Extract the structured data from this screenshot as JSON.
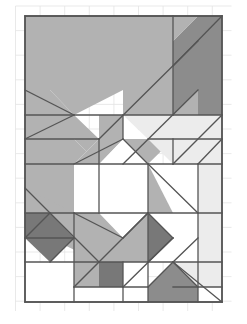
{
  "figure": {
    "type": "vector-diagram",
    "canvas": {
      "width": 247,
      "height": 324,
      "background": "#ffffff"
    },
    "grid": {
      "name": "light-reference-grid",
      "visible": true,
      "stroke": "#e3e3e3",
      "stroke_width": 0.8,
      "cell_width": 24.6,
      "cell_height": 24.6,
      "x_start": 15.5,
      "x_end": 231.5,
      "y_start": 6.0,
      "y_end": 311.0,
      "columns": 9,
      "rows": 13
    },
    "frame": {
      "name": "outer-rectangle",
      "x": 25,
      "y": 16,
      "width": 197,
      "height": 286,
      "stroke": "#555555",
      "stroke_width": 1.6,
      "fill": "none"
    },
    "palette": {
      "white": "#ffffff",
      "light_gray": "#ececec",
      "mid_gray": "#b2b2b2",
      "gray": "#a3a3a3",
      "dark_gray": "#8c8c8c",
      "darkest_gray": "#787878",
      "outline": "#555555",
      "grid_line": "#e3e3e3"
    },
    "shapes": [
      {
        "id": "s01",
        "name": "top-large-slab",
        "fill": "#b2b2b2",
        "points": "25,16 173,16 173,41 198,66 198,115 123,115 123,90 74,115 25,115"
      },
      {
        "id": "s02",
        "name": "top-left-notch-triangle",
        "fill": "#ffffff",
        "points": "25,90 50,90 74,115 25,115"
      },
      {
        "id": "s03",
        "name": "upper-left-wedge",
        "fill": "#b2b2b2",
        "points": "25,90 50,90 74,115 25,139"
      },
      {
        "id": "s04",
        "name": "top-right-dark-block",
        "fill": "#8c8c8c",
        "points": "173,41 198,16 222,16 222,115 173,115"
      },
      {
        "id": "s05",
        "name": "top-right-diagonal-band",
        "fill": "#b2b2b2",
        "points": "173,16 198,16 173,41"
      },
      {
        "id": "s06",
        "name": "left-mid-band",
        "fill": "#b2b2b2",
        "points": "25,115 74,115 99,139 99,164 74,139 25,139"
      },
      {
        "id": "s07",
        "name": "left-column-block",
        "fill": "#b2b2b2",
        "points": "25,139 74,139 99,164 74,213 25,213"
      },
      {
        "id": "s08",
        "name": "center-upper-fan-left",
        "fill": "#b2b2b2",
        "points": "99,115 123,115 123,139 99,164"
      },
      {
        "id": "s09",
        "name": "center-upper-white-wedge",
        "fill": "#ffffff",
        "points": "123,115 148,139 123,139"
      },
      {
        "id": "s10",
        "name": "center-diagonal-band",
        "fill": "#b2b2b2",
        "points": "123,139 148,139 198,90 198,115 148,164"
      },
      {
        "id": "s11",
        "name": "right-light-panel",
        "fill": "#ececec",
        "points": "148,115 198,115 198,164 173,164 148,139"
      },
      {
        "id": "s12",
        "name": "right-light-upper",
        "fill": "#ececec",
        "points": "123,115 198,115 173,139 148,139"
      },
      {
        "id": "s13",
        "name": "octagon-center",
        "fill": "#ffffff",
        "points": "99,164 123,139 148,164 148,213 123,238 99,213"
      },
      {
        "id": "s14",
        "name": "octagon-left-facet",
        "fill": "#ffffff",
        "points": "74,164 99,139 99,213 74,213"
      },
      {
        "id": "s15",
        "name": "octagon-upper-left-gray",
        "fill": "#b2b2b2",
        "points": "74,164 99,139 123,139 99,164"
      },
      {
        "id": "s16",
        "name": "center-right-gray-column",
        "fill": "#b2b2b2",
        "points": "148,164 173,164 198,188 173,213 148,213"
      },
      {
        "id": "s17",
        "name": "right-mid-light",
        "fill": "#ececec",
        "points": "173,139 198,115 222,115 222,164 198,164"
      },
      {
        "id": "s18",
        "name": "right-tall-light-band",
        "fill": "#ececec",
        "points": "198,164 222,164 222,262 198,287 173,262 198,238"
      },
      {
        "id": "s19",
        "name": "right-white-triangle",
        "fill": "#ffffff",
        "points": "148,164 198,164 198,213 173,213"
      },
      {
        "id": "s20",
        "name": "right-lower-white",
        "fill": "#ffffff",
        "points": "148,213 198,213 198,262 148,262"
      },
      {
        "id": "s21",
        "name": "lower-left-mid-gray",
        "fill": "#b2b2b2",
        "points": "25,188 74,213 99,213 123,238 99,262 50,238 25,213"
      },
      {
        "id": "s22",
        "name": "dark-diamond-left",
        "fill": "#787878",
        "points": "25,213 50,213 74,238 50,262 25,238"
      },
      {
        "id": "s23",
        "name": "lower-left-white",
        "fill": "#ffffff",
        "points": "25,262 74,262 74,302 25,302"
      },
      {
        "id": "s24",
        "name": "lower-center-band",
        "fill": "#b2b2b2",
        "points": "74,238 99,262 148,213 173,238 123,287 74,287"
      },
      {
        "id": "s25",
        "name": "dark-triangle-center",
        "fill": "#787878",
        "points": "99,262 148,262 148,287 99,287"
      },
      {
        "id": "s26",
        "name": "dark-triangle-lower-right",
        "fill": "#787878",
        "points": "148,213 173,238 148,262"
      },
      {
        "id": "s27",
        "name": "lower-white-strip",
        "fill": "#ffffff",
        "points": "74,287 123,287 123,302 74,302"
      },
      {
        "id": "s28",
        "name": "bottom-white-panel",
        "fill": "#ffffff",
        "points": "123,262 148,262 148,302 123,302"
      },
      {
        "id": "s29",
        "name": "bottom-dark-wedge",
        "fill": "#8c8c8c",
        "points": "148,287 173,262 198,287 198,302 148,302"
      },
      {
        "id": "s30",
        "name": "bottom-light-wedge",
        "fill": "#ececec",
        "points": "173,262 198,262 198,287"
      },
      {
        "id": "s31",
        "name": "bottom-right-white",
        "fill": "#ffffff",
        "points": "198,287 222,287 222,302 198,302"
      },
      {
        "id": "s32",
        "name": "bottom-right-corner-light",
        "fill": "#ececec",
        "points": "198,262 222,262 222,287 198,287"
      }
    ],
    "edges": [
      {
        "name": "edge-frame-top",
        "x1": 25,
        "y1": 16,
        "x2": 222,
        "y2": 16
      },
      {
        "name": "edge-frame-bottom",
        "x1": 25,
        "y1": 302,
        "x2": 222,
        "y2": 302
      },
      {
        "name": "edge-frame-left",
        "x1": 25,
        "y1": 16,
        "x2": 25,
        "y2": 302
      },
      {
        "name": "edge-frame-right",
        "x1": 222,
        "y1": 16,
        "x2": 222,
        "y2": 302
      },
      {
        "name": "edge-top-slab-bottom",
        "x1": 25,
        "y1": 115,
        "x2": 222,
        "y2": 115
      },
      {
        "name": "edge-row-164",
        "x1": 25,
        "y1": 164,
        "x2": 222,
        "y2": 164
      },
      {
        "name": "edge-row-213",
        "x1": 25,
        "y1": 213,
        "x2": 222,
        "y2": 213
      },
      {
        "name": "edge-row-262",
        "x1": 25,
        "y1": 262,
        "x2": 222,
        "y2": 262
      },
      {
        "name": "edge-row-139-left",
        "x1": 25,
        "y1": 139,
        "x2": 99,
        "y2": 139
      },
      {
        "name": "edge-row-139-right",
        "x1": 148,
        "y1": 139,
        "x2": 222,
        "y2": 139
      },
      {
        "name": "edge-row-238-left",
        "x1": 25,
        "y1": 238,
        "x2": 74,
        "y2": 238
      },
      {
        "name": "edge-row-287-part",
        "x1": 74,
        "y1": 287,
        "x2": 148,
        "y2": 287
      },
      {
        "name": "edge-row-287-right",
        "x1": 173,
        "y1": 287,
        "x2": 222,
        "y2": 287
      },
      {
        "name": "edge-col-74",
        "x1": 74,
        "y1": 213,
        "x2": 74,
        "y2": 302
      },
      {
        "name": "edge-col-99",
        "x1": 99,
        "y1": 139,
        "x2": 99,
        "y2": 213
      },
      {
        "name": "edge-col-123-top",
        "x1": 123,
        "y1": 115,
        "x2": 123,
        "y2": 139
      },
      {
        "name": "edge-col-123-bottom",
        "x1": 123,
        "y1": 262,
        "x2": 123,
        "y2": 302
      },
      {
        "name": "edge-col-148-mid",
        "x1": 148,
        "y1": 164,
        "x2": 148,
        "y2": 262
      },
      {
        "name": "edge-col-148-bottom",
        "x1": 148,
        "y1": 262,
        "x2": 148,
        "y2": 302
      },
      {
        "name": "edge-col-173-top",
        "x1": 173,
        "y1": 16,
        "x2": 173,
        "y2": 115
      },
      {
        "name": "edge-col-173-mid",
        "x1": 173,
        "y1": 139,
        "x2": 173,
        "y2": 164
      },
      {
        "name": "edge-col-198-mid",
        "x1": 198,
        "y1": 164,
        "x2": 198,
        "y2": 302
      },
      {
        "name": "edge-diag-tr",
        "x1": 173,
        "y1": 66,
        "x2": 222,
        "y2": 16
      },
      {
        "name": "edge-diag-long-ne",
        "x1": 99,
        "y1": 139,
        "x2": 198,
        "y2": 41
      },
      {
        "name": "edge-diag-band2",
        "x1": 123,
        "y1": 164,
        "x2": 198,
        "y2": 90
      },
      {
        "name": "edge-diag-ul-1",
        "x1": 25,
        "y1": 90,
        "x2": 74,
        "y2": 115
      },
      {
        "name": "edge-diag-ul-2",
        "x1": 25,
        "y1": 139,
        "x2": 74,
        "y2": 115
      },
      {
        "name": "edge-diag-oct-ul",
        "x1": 74,
        "y1": 164,
        "x2": 123,
        "y2": 139
      },
      {
        "name": "edge-diag-oct-ur",
        "x1": 123,
        "y1": 139,
        "x2": 148,
        "y2": 164
      },
      {
        "name": "edge-diag-oct-ll",
        "x1": 74,
        "y1": 213,
        "x2": 123,
        "y2": 238
      },
      {
        "name": "edge-diag-oct-lr",
        "x1": 123,
        "y1": 238,
        "x2": 148,
        "y2": 213
      },
      {
        "name": "edge-diag-ll-1",
        "x1": 25,
        "y1": 188,
        "x2": 99,
        "y2": 262
      },
      {
        "name": "edge-diag-ll-2",
        "x1": 25,
        "y1": 238,
        "x2": 50,
        "y2": 213
      },
      {
        "name": "edge-diag-ll-3",
        "x1": 50,
        "y1": 262,
        "x2": 74,
        "y2": 238
      },
      {
        "name": "edge-diag-mid-band",
        "x1": 74,
        "y1": 287,
        "x2": 148,
        "y2": 213
      },
      {
        "name": "edge-diag-mid-band2",
        "x1": 123,
        "y1": 287,
        "x2": 173,
        "y2": 238
      },
      {
        "name": "edge-diag-right-1",
        "x1": 148,
        "y1": 164,
        "x2": 198,
        "y2": 213
      },
      {
        "name": "edge-diag-right-2",
        "x1": 173,
        "y1": 164,
        "x2": 222,
        "y2": 115
      },
      {
        "name": "edge-diag-right-3",
        "x1": 198,
        "y1": 164,
        "x2": 222,
        "y2": 139
      },
      {
        "name": "edge-diag-right-4",
        "x1": 173,
        "y1": 262,
        "x2": 198,
        "y2": 238
      },
      {
        "name": "edge-diag-right-5",
        "x1": 173,
        "y1": 262,
        "x2": 198,
        "y2": 287
      },
      {
        "name": "edge-diag-bottom-1",
        "x1": 148,
        "y1": 287,
        "x2": 173,
        "y2": 262
      },
      {
        "name": "edge-diag-bottom-2",
        "x1": 173,
        "y1": 262,
        "x2": 222,
        "y2": 302
      },
      {
        "name": "edge-diag-dark-lr",
        "x1": 148,
        "y1": 213,
        "x2": 173,
        "y2": 238
      },
      {
        "name": "edge-diag-dark-lr2",
        "x1": 173,
        "y1": 238,
        "x2": 148,
        "y2": 262
      }
    ]
  }
}
